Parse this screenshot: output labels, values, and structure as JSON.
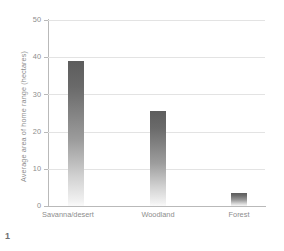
{
  "figure": {
    "number": "1"
  },
  "chart_data": {
    "type": "bar",
    "title": "",
    "subtitle": "",
    "xlabel": "",
    "ylabel": "Average area of home range (hectares)",
    "categories": [
      "Savanna/desert",
      "Woodland",
      "Forest"
    ],
    "values": [
      39,
      25.5,
      3.5
    ],
    "series": [
      {
        "name": "Average area of home range",
        "values": [
          39,
          25.5,
          3.5
        ]
      }
    ],
    "ylim": [
      0,
      50
    ],
    "yticks": [
      0,
      10,
      20,
      30,
      40,
      50
    ],
    "ytick_labels": [
      "0",
      "10",
      "20",
      "30",
      "40",
      "50"
    ],
    "grid": true,
    "grid_axis": "y",
    "legend": false,
    "legend_position": "none",
    "annotations": [],
    "colors": {
      "bar_top": "#5d5d5d",
      "bar_bottom": "#fafafa",
      "gridline": "#e3e3e3",
      "axis": "#b9b9b9",
      "text": "#8d8d8d",
      "background": "#ffffff"
    }
  }
}
